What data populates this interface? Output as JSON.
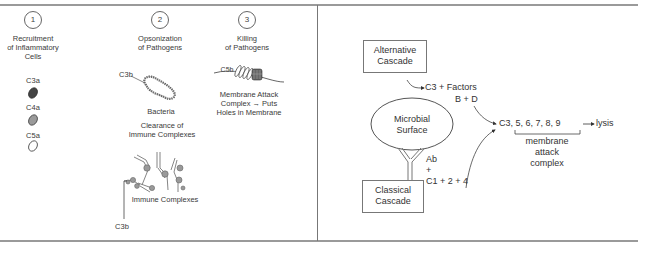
{
  "left_panel": {
    "col1": {
      "number": "1",
      "title_lines": [
        "Recruitment",
        "of Inflammatory",
        "Cells"
      ],
      "items": [
        {
          "label": "C3a",
          "shape": "dark-oval",
          "color": "#444444"
        },
        {
          "label": "C4a",
          "shape": "gray-oval",
          "color": "#9a9a9a"
        },
        {
          "label": "C5a",
          "shape": "outline-oval",
          "color": "#ffffff"
        }
      ]
    },
    "col2": {
      "number": "2",
      "title_lines": [
        "Opsonization",
        "of Pathogens"
      ],
      "c3b_label": "C3b",
      "bacteria_label": "Bacteria",
      "clearance_lines": [
        "Clearance of",
        "Immune Complexes"
      ],
      "immune_complexes_label": "Immune Complexes",
      "c3b_bottom_label": "C3b"
    },
    "col3": {
      "number": "3",
      "title_lines": [
        "Killing",
        "of Pathogens"
      ],
      "c5b_label": "C5b",
      "mac_lines": [
        "Membrane Attack",
        "Complex → Puts",
        "Holes in Membrane"
      ]
    }
  },
  "right_panel": {
    "alternative_box": [
      "Alternative",
      "Cascade"
    ],
    "c3_factors_lines": [
      "C3 + Factors",
      "B + D"
    ],
    "microbial_surface": [
      "Microbial",
      "Surface"
    ],
    "ab_lines": [
      "Ab",
      "+",
      "C1 + 2 + 4"
    ],
    "classical_box": [
      "Classical",
      "Cascade"
    ],
    "terminal": "C3, 5, 6, 7, 8, 9",
    "lysis": "lysis",
    "mac_lines": [
      "membrane",
      "attack",
      "complex"
    ]
  }
}
